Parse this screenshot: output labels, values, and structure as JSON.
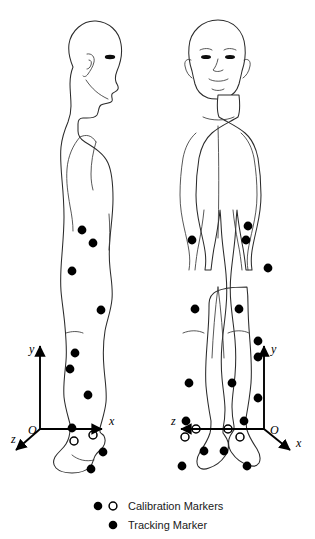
{
  "diagram": {
    "background_color": "#ffffff",
    "stroke_color": "#2b2b2b",
    "marker_color": "#000000"
  },
  "legend": {
    "rows": [
      {
        "id": "calibration",
        "label": "Calibration Markers",
        "symbols": [
          "filled-circle",
          "open-circle"
        ]
      },
      {
        "id": "tracking",
        "label": "Tracking Marker",
        "symbols": [
          "filled-circle"
        ]
      }
    ]
  },
  "figures": [
    {
      "id": "sagittal-view",
      "view": "lateral",
      "facing": "right",
      "axes": {
        "origin_label": "O",
        "x_label": "x",
        "y_label": "y",
        "z_label": "z",
        "origin": {
          "x": 40,
          "y": 429
        },
        "x_tip": {
          "x": 105,
          "y": 429
        },
        "y_tip": {
          "x": 40,
          "y": 343
        },
        "z_tip": {
          "x": 13,
          "y": 452
        },
        "origin_text": {
          "x": 30,
          "y": 433
        },
        "x_text": {
          "x": 109,
          "y": 425
        },
        "y_text": {
          "x": 29,
          "y": 353
        },
        "z_text": {
          "x": 13,
          "y": 442
        }
      },
      "markers": [
        {
          "x": 82,
          "y": 230,
          "type": "tracking"
        },
        {
          "x": 93,
          "y": 243,
          "type": "tracking"
        },
        {
          "x": 72,
          "y": 271,
          "type": "tracking"
        },
        {
          "x": 101,
          "y": 310,
          "type": "tracking"
        },
        {
          "x": 75,
          "y": 353,
          "type": "tracking"
        },
        {
          "x": 70,
          "y": 369,
          "type": "tracking"
        },
        {
          "x": 88,
          "y": 395,
          "type": "tracking"
        },
        {
          "x": 72,
          "y": 428,
          "type": "tracking"
        },
        {
          "x": 74,
          "y": 441,
          "type": "calibration"
        },
        {
          "x": 93,
          "y": 435,
          "type": "calibration"
        },
        {
          "x": 103,
          "y": 452,
          "type": "tracking"
        },
        {
          "x": 91,
          "y": 469,
          "type": "tracking"
        }
      ]
    },
    {
      "id": "frontal-view",
      "view": "anterior",
      "facing": "viewer",
      "axes": {
        "origin_label": "O",
        "x_label": "x",
        "y_label": "y",
        "z_label": "z",
        "origin": {
          "x": 264,
          "y": 429
        },
        "x_tip": {
          "x": 292,
          "y": 452
        },
        "y_tip": {
          "x": 264,
          "y": 343
        },
        "z_tip": {
          "x": 178,
          "y": 429
        },
        "origin_text": {
          "x": 270,
          "y": 433
        },
        "x_text": {
          "x": 299,
          "y": 446
        },
        "y_text": {
          "x": 272,
          "y": 353
        },
        "z_text": {
          "x": 172,
          "y": 424
        }
      },
      "markers": [
        {
          "x": 248,
          "y": 226,
          "type": "tracking"
        },
        {
          "x": 192,
          "y": 240,
          "type": "tracking"
        },
        {
          "x": 246,
          "y": 240,
          "type": "tracking"
        },
        {
          "x": 268,
          "y": 268,
          "type": "tracking"
        },
        {
          "x": 195,
          "y": 309,
          "type": "tracking"
        },
        {
          "x": 239,
          "y": 309,
          "type": "tracking"
        },
        {
          "x": 258,
          "y": 341,
          "type": "tracking"
        },
        {
          "x": 258,
          "y": 357,
          "type": "tracking"
        },
        {
          "x": 189,
          "y": 383,
          "type": "tracking"
        },
        {
          "x": 232,
          "y": 383,
          "type": "tracking"
        },
        {
          "x": 258,
          "y": 398,
          "type": "tracking"
        },
        {
          "x": 186,
          "y": 421,
          "type": "tracking"
        },
        {
          "x": 244,
          "y": 421,
          "type": "tracking"
        },
        {
          "x": 196,
          "y": 429,
          "type": "calibration"
        },
        {
          "x": 185,
          "y": 437,
          "type": "calibration"
        },
        {
          "x": 228,
          "y": 429,
          "type": "calibration"
        },
        {
          "x": 240,
          "y": 437,
          "type": "calibration"
        },
        {
          "x": 204,
          "y": 451,
          "type": "tracking"
        },
        {
          "x": 182,
          "y": 466,
          "type": "tracking"
        },
        {
          "x": 224,
          "y": 451,
          "type": "tracking"
        },
        {
          "x": 247,
          "y": 466,
          "type": "tracking"
        }
      ]
    }
  ]
}
